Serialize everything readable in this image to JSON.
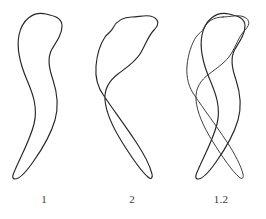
{
  "figure": {
    "background_color": "#ffffff",
    "stroke_color": "#262626",
    "label_color": "#3a3a3a",
    "panel_count": 3,
    "panels": [
      {
        "id": "shape-1",
        "label": "1",
        "description": "closed hand-drawn outline, rounded bulb at top, tapering tail curving down and to the left",
        "shapes": [
          "contour-1"
        ]
      },
      {
        "id": "shape-2",
        "label": "2",
        "description": "closed hand-drawn outline, rounded bulb at top-right with a notch on the upper-left, tapering tail curving down and to the right",
        "shapes": [
          "contour-2"
        ]
      },
      {
        "id": "shape-overlay",
        "label": "1.2",
        "description": "superimposed overlay of contour 1 and contour 2, bulbs aligned at top, tails crossing in an X at the bottom",
        "shapes": [
          "contour-1",
          "contour-2"
        ]
      }
    ]
  },
  "chart_data": {
    "type": "line",
    "title": "",
    "subtitle": "",
    "xlabel": "",
    "ylabel": "",
    "grid": false,
    "legend": "none",
    "axes": "none",
    "xlim": [
      0,
      88
    ],
    "ylim": [
      0,
      192
    ],
    "annotations": [
      "1",
      "2",
      "1.2"
    ],
    "series": [
      {
        "name": "contour-1",
        "closed": true,
        "panel": [
          "shape-1",
          "shape-overlay"
        ],
        "path": "M 46 14 C 33 11, 22 20, 19 35 C 16 50, 21 66, 27 80 C 33 94, 38 108, 34 124 C 30 140, 21 156, 15 170 C 12 176, 12 179, 15 179 C 19 179, 26 172, 33 162 C 43 148, 51 134, 55 120 C 59 106, 57 92, 53 80 C 49 68, 47 58, 52 49 C 57 41, 62 34, 62 26 C 62 18, 55 16, 46 14 Z"
      },
      {
        "name": "contour-2",
        "closed": true,
        "panel": [
          "shape-2",
          "shape-overlay"
        ],
        "path": "M 44 17 C 34 17, 28 22, 25 28 C 23 32, 20 33, 17 37 C 13 43, 9 54, 8 66 C 7 78, 10 88, 16 96 C 24 108, 36 124, 48 142 C 56 154, 62 166, 64 174 C 65 178, 63 180, 60 177 C 54 172, 44 158, 34 142 C 24 126, 18 112, 17 100 C 16 88, 22 80, 30 74 C 38 68, 47 62, 52 54 C 57 46, 60 36, 66 30 C 72 24, 71 18, 62 16 C 56 15, 50 17, 44 17 Z"
      }
    ]
  }
}
